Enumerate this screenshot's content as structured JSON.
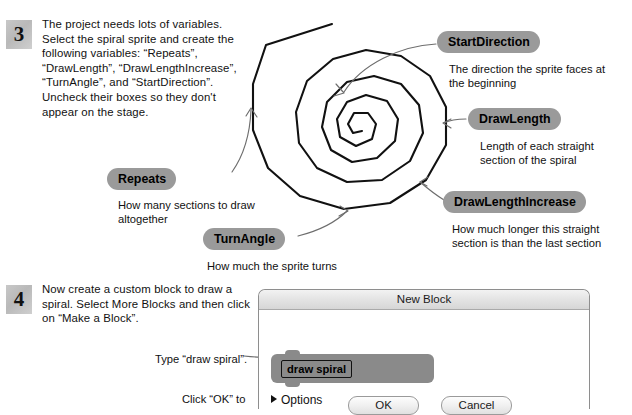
{
  "steps": [
    {
      "number": "3",
      "text": "The project needs lots of variables. Select the spiral sprite and create the following variables: “Repeats”, “DrawLength”, “DrawLengthIncrease”, “TurnAngle”, and “StartDirection”. Uncheck their boxes so they don't appear on the stage."
    },
    {
      "number": "4",
      "text": "Now create a custom block to draw a spiral. Select More Blocks and then click on “Make a Block”."
    }
  ],
  "callouts": [
    {
      "label": "StartDirection",
      "caption": "The direction the sprite faces at the beginning"
    },
    {
      "label": "DrawLength",
      "caption": "Length of each straight section of the spiral"
    },
    {
      "label": "DrawLengthIncrease",
      "caption": "How much longer this straight section is than the last section"
    },
    {
      "label": "Repeats",
      "caption": "How many sections to draw altogether"
    },
    {
      "label": "TurnAngle",
      "caption": "How much the sprite turns"
    }
  ],
  "annotations": {
    "type_hint": "Type “draw spiral”.",
    "click_ok_hint": "Click “OK” to"
  },
  "dialog": {
    "title": "New Block",
    "block_text": "draw spiral",
    "options_label": "Options",
    "ok_label": "OK",
    "cancel_label": "Cancel"
  },
  "colors": {
    "pill_gray": "#9a9a9a",
    "badge_gray": "#c2c2c2",
    "block_gray": "#8a8a8a",
    "ink": "#111111"
  },
  "icons": {
    "options_disclosure": "triangle-right-icon",
    "spiral": "spiral-illustration"
  }
}
